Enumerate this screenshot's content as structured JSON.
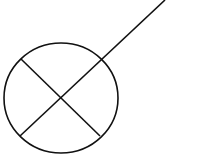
{
  "diagram": {
    "type": "symbol",
    "stroke_color": "#111111",
    "background": "#ffffff",
    "circle": {
      "cx": 61,
      "cy": 98,
      "rx": 57,
      "ry": 55
    },
    "cross_line_1": {
      "x1": 21,
      "y1": 59,
      "x2": 100,
      "y2": 136
    },
    "cross_line_2": {
      "x1": 20,
      "y1": 136,
      "x2": 165,
      "y2": 0
    }
  }
}
